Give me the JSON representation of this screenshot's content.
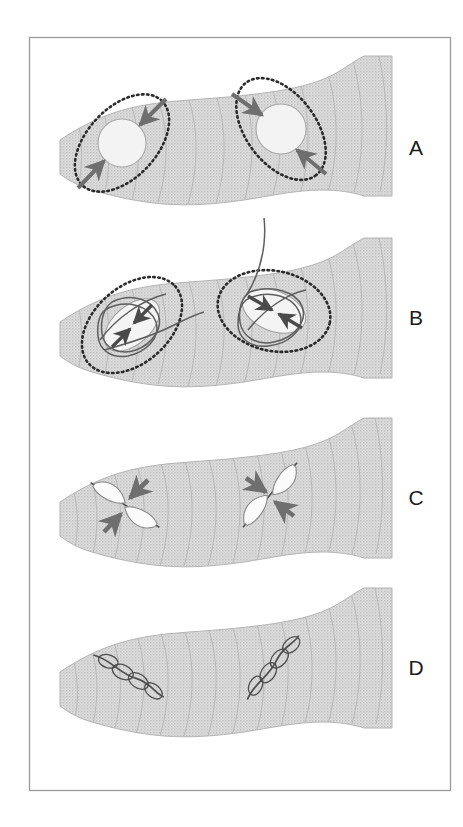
{
  "figure": {
    "border_color": "#9a9a9a",
    "background_color": "#ffffff",
    "membrane_fill": "#d8d8d8",
    "membrane_stroke": "#b0b0b0",
    "contour_color": "#b6b6b6",
    "pore_fill": "#f2f2f2",
    "pore_stroke": "#aaaaaa",
    "dotted_ring_color": "#2b2b2b",
    "arrow_color": "#6f6f6f",
    "filament_color": "#5e5e5e",
    "spindle_fill": "#fbfbfb",
    "spindle_stroke": "#8a8a8a",
    "label_color": "#1c1c1c"
  },
  "panels": [
    {
      "id": "panel-a",
      "label": "A",
      "label_x": 416,
      "label_y": 155,
      "stage": "open pore",
      "structures": [
        {
          "name": "left-pore",
          "kind": "circular-pore",
          "cx": 122,
          "cy": 143,
          "radius": 24,
          "ring_rx": 58,
          "ring_ry": 35,
          "ring_rotation": -47,
          "arrows": 2,
          "arrow_direction": "inward"
        },
        {
          "name": "right-pore",
          "kind": "circular-pore",
          "cx": 281,
          "cy": 129,
          "radius": 24,
          "ring_rx": 58,
          "ring_ry": 35,
          "ring_rotation": 53,
          "arrows": 2,
          "arrow_direction": "inward"
        }
      ]
    },
    {
      "id": "panel-b",
      "label": "B",
      "label_x": 416,
      "label_y": 325,
      "stage": "constricting pore with filaments",
      "structures": [
        {
          "name": "left-pore",
          "kind": "constricted-pore",
          "cx": 132,
          "cy": 325,
          "lens_rx": 33,
          "lens_ry": 19,
          "lens_rotation": -42,
          "ring_rx": 58,
          "ring_ry": 38,
          "ring_rotation": -42,
          "arrows": 2,
          "arrow_direction": "inward",
          "filament_tail": "right"
        },
        {
          "name": "right-pore",
          "kind": "constricted-pore",
          "cx": 274,
          "cy": 311,
          "lens_rx": 33,
          "lens_ry": 19,
          "lens_rotation": 22,
          "ring_rx": 57,
          "ring_ry": 40,
          "ring_rotation": 12,
          "arrows": 2,
          "arrow_direction": "inward",
          "filament_tail": "up"
        }
      ]
    },
    {
      "id": "panel-c",
      "label": "C",
      "label_x": 416,
      "label_y": 505,
      "stage": "narrow slit with crossing arrows",
      "structures": [
        {
          "name": "left-slit",
          "kind": "spindle-pair",
          "cx": 125,
          "cy": 505,
          "length": 58,
          "rotation": 33,
          "arrows": 2,
          "arrow_direction": "inward"
        },
        {
          "name": "right-slit",
          "kind": "spindle-pair",
          "cx": 270,
          "cy": 495,
          "length": 62,
          "rotation": -50,
          "arrows": 2,
          "arrow_direction": "inward"
        }
      ]
    },
    {
      "id": "panel-d",
      "label": "D",
      "label_x": 416,
      "label_y": 675,
      "stage": "sealed scar",
      "structures": [
        {
          "name": "left-scar",
          "kind": "bead-chain",
          "cx": 128,
          "cy": 675,
          "length": 76,
          "rotation": 30,
          "beads": 4
        },
        {
          "name": "right-scar",
          "kind": "bead-chain",
          "cx": 272,
          "cy": 668,
          "length": 76,
          "rotation": -52,
          "beads": 4
        }
      ]
    }
  ],
  "border": {
    "x": 29,
    "y": 37,
    "width": 421,
    "height": 753
  }
}
